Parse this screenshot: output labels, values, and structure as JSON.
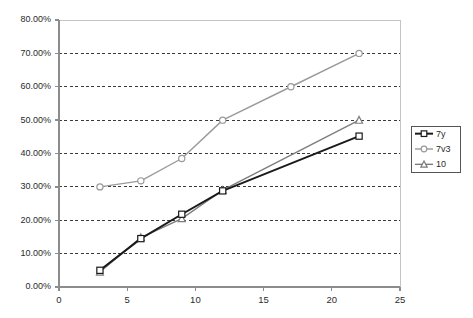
{
  "chart_data": {
    "type": "line",
    "title": "",
    "subtitle": "",
    "xlabel": "",
    "ylabel": "",
    "xlim": [
      0,
      25
    ],
    "ylim": [
      0,
      0.8
    ],
    "grid": true,
    "grid_axis": "y",
    "legend_position": "right",
    "x_ticks": [
      0,
      5,
      10,
      15,
      20,
      25
    ],
    "x_tick_labels": [
      "0",
      "5",
      "10",
      "15",
      "20",
      "25"
    ],
    "y_ticks": [
      0,
      0.1,
      0.2,
      0.3,
      0.4,
      0.5,
      0.6,
      0.7,
      0.8
    ],
    "y_tick_labels": [
      "0.00%",
      "10.00%",
      "20.00%",
      "30.00%",
      "40.00%",
      "50.00%",
      "60.00%",
      "70.00%",
      "80.00%"
    ],
    "series": [
      {
        "name": "7y",
        "color": "#1a1a1a",
        "marker": "square",
        "x": [
          3,
          6,
          9,
          12,
          22
        ],
        "values": [
          0.05,
          0.145,
          0.218,
          0.288,
          0.452
        ]
      },
      {
        "name": "7v3",
        "color": "#9a9a9a",
        "marker": "circle",
        "x": [
          3,
          6,
          9,
          12,
          17,
          22
        ],
        "values": [
          0.3,
          0.318,
          0.385,
          0.5,
          0.6,
          0.7
        ]
      },
      {
        "name": "10",
        "color": "#7d7d7d",
        "marker": "triangle",
        "x": [
          3,
          6,
          9,
          12,
          22
        ],
        "values": [
          0.045,
          0.148,
          0.205,
          0.29,
          0.5
        ]
      }
    ]
  },
  "legend": {
    "entries": [
      {
        "label": "7y"
      },
      {
        "label": "7v3"
      },
      {
        "label": "10"
      }
    ]
  },
  "colors": {
    "axis": "#8c8c8c",
    "grid": "#3a3a3a",
    "plot_background": "#ffffff",
    "legend_border": "#555555"
  }
}
